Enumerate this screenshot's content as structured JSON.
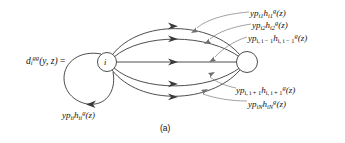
{
  "figure": {
    "caption": "(a)",
    "background_color": "#ffffff",
    "stroke_color": "#3a3a3a",
    "text_color": "#111111"
  },
  "equation": {
    "lhs_var": "d",
    "lhs_sub": "i",
    "lhs_sup": "gg",
    "lhs_args": "(y, z)",
    "equals": "="
  },
  "nodes": [
    {
      "id": "i",
      "label": "i",
      "x": 107,
      "y": 62,
      "r": 9.5,
      "filled": false
    },
    {
      "id": "right",
      "label": "",
      "x": 247,
      "y": 62,
      "r": 10.5,
      "filled": false
    }
  ],
  "edges": [
    {
      "name": "edge-1",
      "from": "i",
      "to": "right",
      "label_ref": "lbl-1"
    },
    {
      "name": "edge-2",
      "from": "i",
      "to": "right",
      "label_ref": "lbl-2"
    },
    {
      "name": "edge-3",
      "from": "i",
      "to": "right",
      "label_ref": "lbl-3"
    },
    {
      "name": "edge-4",
      "from": "i",
      "to": "right",
      "label_ref": "lbl-4"
    },
    {
      "name": "edge-5",
      "from": "i",
      "to": "right",
      "label_ref": "lbl-5"
    },
    {
      "name": "self-loop",
      "from": "i",
      "to": "i",
      "label_ref": "lbl-self"
    }
  ],
  "labels": {
    "edge_1": {
      "coef": "yp",
      "coef_sub": "i1",
      "h": "h",
      "h_sub": "i1",
      "h_sup": "g",
      "arg": "(z)"
    },
    "edge_2": {
      "coef": "yp",
      "coef_sub": "i2",
      "h": "h",
      "h_sub": "i2",
      "h_sup": "g",
      "arg": "(z)"
    },
    "edge_3": {
      "coef": "yp",
      "coef_sub": "i, i − 1",
      "h": "h",
      "h_sub": "i, i − 1",
      "h_sup": "g",
      "arg": "(z)"
    },
    "edge_4": {
      "coef": "yp",
      "coef_sub": "i, i + 1",
      "h": "h",
      "h_sub": "i, i + 1",
      "h_sup": "g",
      "arg": "(z)"
    },
    "edge_5": {
      "coef": "yp",
      "coef_sub": "iN",
      "h": "h",
      "h_sub": "iN",
      "h_sup": "g",
      "arg": "(z)"
    },
    "self_loop": {
      "coef": "yp",
      "coef_sub": "ii",
      "h": "h",
      "h_sub": "ii",
      "h_sup": "g",
      "arg": "(z)"
    }
  }
}
